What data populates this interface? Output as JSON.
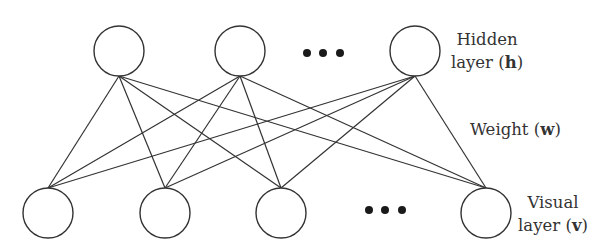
{
  "diagram": {
    "type": "restricted-boltzmann-machine",
    "hidden_layer": {
      "label_line1": "Hidden",
      "label_line2_prefix": "layer (",
      "label_symbol": "h",
      "label_line2_suffix": ")",
      "nodes": [
        {
          "id": "h1",
          "cx": 119,
          "cy": 51
        },
        {
          "id": "h2",
          "cx": 240,
          "cy": 51
        },
        {
          "id": "h3",
          "cx": 415,
          "cy": 51
        }
      ],
      "ellipsis_dots": [
        {
          "cx": 307,
          "cy": 53
        },
        {
          "cx": 323,
          "cy": 53
        },
        {
          "cx": 340,
          "cy": 53
        }
      ]
    },
    "visual_layer": {
      "label_line1": "Visual",
      "label_line2_prefix": "layer (",
      "label_symbol": "v",
      "label_line2_suffix": ")",
      "nodes": [
        {
          "id": "v1",
          "cx": 48,
          "cy": 213
        },
        {
          "id": "v2",
          "cx": 165,
          "cy": 213
        },
        {
          "id": "v3",
          "cx": 281,
          "cy": 213
        },
        {
          "id": "v4",
          "cx": 486,
          "cy": 213
        }
      ],
      "ellipsis_dots": [
        {
          "cx": 369,
          "cy": 210
        },
        {
          "cx": 385,
          "cy": 210
        },
        {
          "cx": 402,
          "cy": 210
        }
      ]
    },
    "weight": {
      "label_prefix": "Weight (",
      "label_symbol": "w",
      "label_suffix": ")"
    },
    "node_radius": 25,
    "connectivity": "fully-connected bipartite"
  }
}
